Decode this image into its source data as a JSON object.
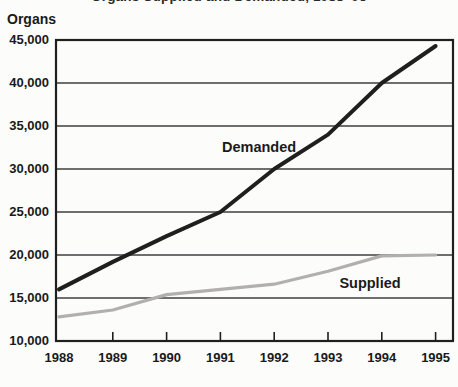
{
  "chart_data": {
    "type": "line",
    "title": "Organs Supplied and Demanded, 1988–95",
    "ylabel": "Organs",
    "xlabel": "",
    "x_labels": [
      "1988",
      "1989",
      "1990",
      "1991",
      "1992",
      "1993",
      "1994",
      "1995"
    ],
    "y_tick_labels": [
      "10,000",
      "15,000",
      "20,000",
      "25,000",
      "30,000",
      "35,000",
      "40,000",
      "45,000"
    ],
    "ylim": [
      10000,
      45000
    ],
    "ytick_step": 5000,
    "grid": true,
    "legend_position": "inline-labels-on-lines",
    "series": [
      {
        "name": "Demanded",
        "values": [
          16000,
          19200,
          22200,
          25000,
          30000,
          34000,
          40000,
          44300
        ],
        "color": "#1f1f1f",
        "label_anchor": {
          "x_index": 3.72,
          "value": 32600
        }
      },
      {
        "name": "Supplied",
        "values": [
          12800,
          13600,
          15400,
          16000,
          16600,
          18100,
          19900,
          20000
        ],
        "color": "#b1b0ae",
        "label_anchor": {
          "x_index": 5.78,
          "value": 16800
        }
      }
    ],
    "colors": {
      "text": "#1a1a1a",
      "grid": "#3f3f3f",
      "frame": "#1f1f1f",
      "background": "#fcfcfa"
    }
  }
}
